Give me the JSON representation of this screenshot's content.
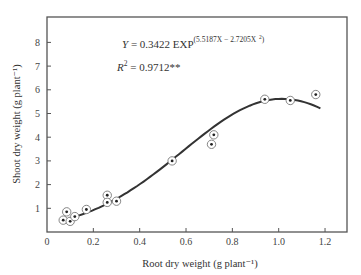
{
  "chart_data": {
    "type": "scatter",
    "title": "",
    "xlabel": "Root dry weight (g plant⁻¹)",
    "ylabel": "Shoot dry weight (g plant⁻¹)",
    "xlim": [
      0,
      1.3
    ],
    "ylim": [
      0,
      9
    ],
    "x_ticks": [
      0,
      0.2,
      0.4,
      0.6,
      0.8,
      1.0,
      1.2
    ],
    "x_tick_labels": [
      "0",
      "0.2",
      "0.4",
      "0.6",
      "0.8",
      "1.0",
      "1.2"
    ],
    "y_ticks": [
      1,
      2,
      3,
      4,
      5,
      6,
      7,
      8
    ],
    "y_tick_labels": [
      "1",
      "2",
      "3",
      "4",
      "5",
      "6",
      "7",
      "8"
    ],
    "grid": false,
    "legend": null,
    "series": [
      {
        "name": "Observed",
        "marker": "circled-dot",
        "x": [
          0.07,
          0.085,
          0.1,
          0.12,
          0.17,
          0.26,
          0.26,
          0.3,
          0.54,
          0.71,
          0.72,
          0.94,
          1.05,
          1.16
        ],
        "y": [
          0.5,
          0.85,
          0.45,
          0.65,
          0.95,
          1.55,
          1.25,
          1.3,
          3.0,
          3.7,
          4.1,
          5.6,
          5.55,
          5.8
        ]
      },
      {
        "name": "Fitted curve",
        "type": "line",
        "equation": "Y = 0.3422 EXP(5.5187X - 2.7205X^2)",
        "a": 0.3422,
        "b": 5.5187,
        "c": -2.7205,
        "x_range": [
          0.07,
          1.18
        ]
      }
    ],
    "annotations": {
      "equation_prefix": "Y = 0.3422 EXP",
      "equation_exponent": "(5.5187X − 2.7205X",
      "equation_exponent_sup": "2",
      "equation_exponent_close": ")",
      "r2_prefix": "R",
      "r2_sup": "2",
      "r2_value": " = 0.9712**"
    }
  }
}
